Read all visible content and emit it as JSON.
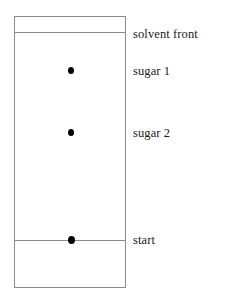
{
  "diagram": {
    "type": "paper-chromatography-plate",
    "plate": {
      "stroke_color": "#8c8c8c",
      "fill_color": "#ffffff"
    },
    "lines": [
      {
        "id": "solvent-front-line",
        "label": "solvent front",
        "y": 32
      },
      {
        "id": "start-line",
        "label": "start",
        "y": 240
      }
    ],
    "spots": [
      {
        "id": "spot-sugar-1",
        "label": "sugar 1",
        "x": 71,
        "y": 71,
        "color": "#000000"
      },
      {
        "id": "spot-sugar-2",
        "label": "sugar 2",
        "x": 71,
        "y": 133,
        "color": "#000000"
      },
      {
        "id": "spot-start",
        "label": "start",
        "x": 72,
        "y": 240,
        "color": "#000000"
      }
    ],
    "labels": {
      "solvent_front": "solvent front",
      "sugar_1": "sugar 1",
      "sugar_2": "sugar 2",
      "start": "start"
    }
  }
}
